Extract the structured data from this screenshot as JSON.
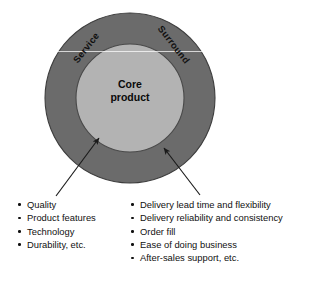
{
  "diagram": {
    "type": "concentric-circles",
    "rings": [
      {
        "id": "outer",
        "labels": [
          "Service",
          "Surround"
        ],
        "fill_color": "#6b6b6b",
        "stroke_color": "#3d3d3d",
        "center": [
          130,
          98
        ],
        "radius": 85
      },
      {
        "id": "inner",
        "label_lines": [
          "Core",
          "product"
        ],
        "fill_color": "#b3b3b3",
        "stroke_color": "#4a4a4a",
        "center": [
          130,
          98
        ],
        "radius": 54
      }
    ],
    "ring_label_service": "Service",
    "ring_label_surround": "Surround",
    "core_line_1": "Core",
    "core_line_2": "product",
    "arrows": [
      {
        "id": "core-arrow",
        "points_to": "inner",
        "tail": [
          56,
          196
        ],
        "head": [
          98,
          137
        ],
        "color": "#1a1a1a"
      },
      {
        "id": "surround-arrow",
        "points_to": "outer",
        "tail": [
          200,
          195
        ],
        "head": [
          163,
          147
        ],
        "color": "#1a1a1a"
      }
    ]
  },
  "lists": {
    "core_attributes": [
      "Quality",
      "Product features",
      "Technology",
      "Durability, etc."
    ],
    "surround_attributes": [
      "Delivery lead time and flexibility",
      "Delivery reliability and consistency",
      "Order fill",
      "Ease of doing business",
      "After-sales support, etc."
    ]
  },
  "colors": {
    "background": "#ffffff",
    "outer_ring": "#6b6b6b",
    "inner_circle": "#b3b3b3",
    "text": "#111111",
    "arrow": "#1a1a1a"
  }
}
